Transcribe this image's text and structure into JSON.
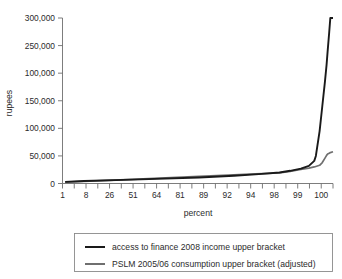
{
  "chart_data": {
    "type": "line",
    "title": "",
    "xlabel": "percent",
    "ylabel": "rupees",
    "grid": false,
    "legend_position": "bottom",
    "xlim": [
      0,
      101
    ],
    "ylim": [
      0,
      300000
    ],
    "y_ticks": [
      {
        "value": 300000,
        "label": "300,000"
      },
      {
        "value": 250000,
        "label": "250,000"
      },
      {
        "value": 200000,
        "label": "100,000"
      },
      {
        "value": 150000,
        "label": "150,000"
      },
      {
        "value": 100000,
        "label": "100,000"
      },
      {
        "value": 50000,
        "label": "50,000"
      },
      {
        "value": 0,
        "label": "0"
      }
    ],
    "x_tick_labels": [
      "1",
      "8",
      "26",
      "51",
      "64",
      "81",
      "89",
      "92",
      "94",
      "98",
      "99",
      "100"
    ],
    "x_minor_tick_count": 24,
    "series": [
      {
        "name": "access to finance 2008 income upper bracket",
        "color": "#1a1a1a",
        "x": [
          1,
          8,
          26,
          51,
          64,
          72,
          81,
          85,
          89,
          92,
          94,
          94.6,
          96,
          97,
          98,
          98.6,
          99,
          99.6,
          100,
          101
        ],
        "values": [
          3000,
          4500,
          7000,
          11000,
          14000,
          16500,
          20000,
          23000,
          27000,
          32000,
          41000,
          50000,
          95000,
          140000,
          185000,
          215000,
          240000,
          275000,
          300000,
          300000
        ]
      },
      {
        "name": "PSLM 2005/06 consumption upper bracket (adjusted)",
        "color": "#6f6f6f",
        "x": [
          1,
          8,
          26,
          51,
          64,
          72,
          81,
          85,
          89,
          92,
          94,
          96,
          97,
          98,
          98.6,
          99,
          99.6,
          100,
          101
        ],
        "values": [
          2500,
          4000,
          7500,
          13000,
          15500,
          17500,
          19000,
          22000,
          25500,
          28000,
          30000,
          33000,
          38000,
          46000,
          51000,
          53500,
          55000,
          56000,
          57500
        ]
      }
    ],
    "legend": [
      {
        "label": "access to finance 2008 income upper bracket",
        "color": "#1a1a1a"
      },
      {
        "label": "PSLM 2005/06 consumption upper bracket (adjusted)",
        "color": "#6f6f6f"
      }
    ]
  },
  "colors": {
    "series_a": "#1a1a1a",
    "series_b": "#6f6f6f",
    "axis": "#6e6e6e",
    "text": "#2b2b2b",
    "background": "#ffffff",
    "legend_border": "#8a8a8a"
  }
}
